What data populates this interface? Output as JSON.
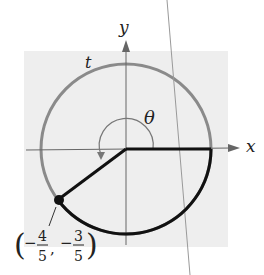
{
  "diagram": {
    "type": "unit-circle",
    "axes": {
      "x_label": "x",
      "y_label": "y"
    },
    "arc_label": "t",
    "angle_label": "θ",
    "point": {
      "x": "-4/5",
      "y": "-3/5",
      "label": {
        "x_sign": "−",
        "x_num": "4",
        "x_den": "5",
        "y_sign": "−",
        "y_num": "3",
        "y_den": "5"
      }
    },
    "colors": {
      "background_panel": "#eeeeee",
      "circle": "#8a8a8a",
      "highlighted_arc": "#111111",
      "axes": "#555555"
    }
  }
}
